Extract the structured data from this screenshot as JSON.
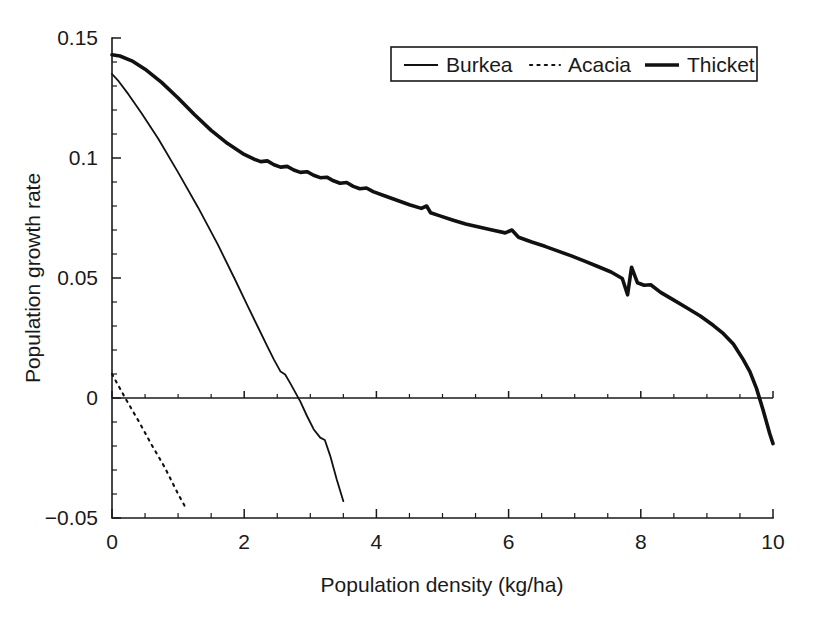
{
  "chart_data": {
    "type": "line",
    "title": "",
    "xlabel": "Population density (kg/ha)",
    "ylabel": "Population growth rate",
    "xlim": [
      0,
      10
    ],
    "ylim": [
      -0.05,
      0.15
    ],
    "xticks": [
      0,
      2,
      4,
      6,
      8,
      10
    ],
    "xticklabels": [
      "0",
      "2",
      "4",
      "6",
      "8",
      "10"
    ],
    "yticks": [
      -0.05,
      0,
      0.05,
      0.1,
      0.15
    ],
    "yticklabels": [
      "-0.05",
      "0",
      "0.05",
      "0.1",
      "0.15"
    ],
    "x_minor_step": 0.5,
    "y_minor_step": 0.01,
    "grid": false,
    "legend_position": "top-right",
    "zero_reference_line": true,
    "series": [
      {
        "name": "Burkea",
        "style": "solid-thin",
        "color": "#111111",
        "x": [
          0.0,
          0.1,
          0.25,
          0.45,
          0.7,
          1.0,
          1.3,
          1.6,
          1.85,
          2.05,
          2.2,
          2.35,
          2.45,
          2.55,
          2.62,
          2.7,
          2.8,
          2.85,
          2.95,
          3.05,
          3.15,
          3.22,
          3.3,
          3.4,
          3.5
        ],
        "y": [
          0.135,
          0.132,
          0.1265,
          0.1185,
          0.108,
          0.094,
          0.0795,
          0.064,
          0.05,
          0.0385,
          0.03,
          0.0215,
          0.016,
          0.011,
          0.0098,
          0.006,
          0.001,
          -0.0015,
          -0.0075,
          -0.013,
          -0.0165,
          -0.0175,
          -0.024,
          -0.034,
          -0.043
        ]
      },
      {
        "name": "Acacia",
        "style": "dotted",
        "color": "#111111",
        "x": [
          0.0,
          0.2,
          0.4,
          0.6,
          0.8,
          1.0,
          1.1
        ],
        "y": [
          0.01,
          0.0,
          -0.0095,
          -0.0195,
          -0.029,
          -0.04,
          -0.045
        ]
      },
      {
        "name": "Thicket",
        "style": "solid-thick",
        "color": "#111111",
        "x": [
          0.0,
          0.12,
          0.3,
          0.5,
          0.75,
          1.0,
          1.25,
          1.5,
          1.75,
          2.0,
          2.15,
          2.25,
          2.35,
          2.45,
          2.55,
          2.65,
          2.75,
          2.85,
          2.95,
          3.05,
          3.15,
          3.25,
          3.35,
          3.45,
          3.55,
          3.65,
          3.75,
          3.85,
          3.95,
          4.1,
          4.3,
          4.5,
          4.68,
          4.76,
          4.82,
          4.95,
          5.15,
          5.35,
          5.55,
          5.75,
          5.95,
          6.05,
          6.15,
          6.35,
          6.55,
          6.75,
          6.95,
          7.15,
          7.35,
          7.55,
          7.72,
          7.8,
          7.86,
          7.95,
          8.05,
          8.15,
          8.3,
          8.5,
          8.7,
          8.9,
          9.1,
          9.25,
          9.4,
          9.55,
          9.65,
          9.75,
          9.85,
          9.95,
          10.0
        ],
        "y": [
          0.143,
          0.1425,
          0.1405,
          0.137,
          0.1315,
          0.125,
          0.118,
          0.1115,
          0.106,
          0.1015,
          0.0995,
          0.0985,
          0.0988,
          0.0972,
          0.0962,
          0.0965,
          0.095,
          0.094,
          0.0943,
          0.0928,
          0.0918,
          0.092,
          0.0905,
          0.0895,
          0.0898,
          0.0882,
          0.0872,
          0.0875,
          0.086,
          0.0845,
          0.0825,
          0.0805,
          0.079,
          0.08,
          0.0772,
          0.076,
          0.0742,
          0.0725,
          0.0712,
          0.07,
          0.0688,
          0.07,
          0.067,
          0.065,
          0.0632,
          0.0612,
          0.0592,
          0.057,
          0.0548,
          0.0525,
          0.0498,
          0.043,
          0.0545,
          0.048,
          0.047,
          0.0472,
          0.044,
          0.0408,
          0.0375,
          0.0342,
          0.0302,
          0.0268,
          0.0225,
          0.016,
          0.011,
          0.004,
          -0.005,
          -0.0148,
          -0.019
        ]
      }
    ]
  },
  "legend": {
    "items": [
      {
        "label": "Burkea",
        "style": "solid-thin"
      },
      {
        "label": "Acacia",
        "style": "dotted"
      },
      {
        "label": "Thicket",
        "style": "solid-thick"
      }
    ]
  }
}
